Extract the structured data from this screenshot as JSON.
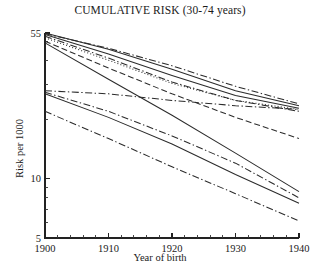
{
  "chart_data": {
    "type": "line",
    "title": "CUMULATIVE RISK (30-74 years)",
    "xlabel": "Year of birth",
    "ylabel": "Risk per 1000",
    "xlim": [
      1900,
      1940
    ],
    "ylim": [
      5,
      55
    ],
    "yscale": "log",
    "xscale": "linear",
    "grid": false,
    "legend": "none",
    "xticks": [
      1900,
      1910,
      1920,
      1930,
      1940
    ],
    "xtick_labels": [
      "1900",
      "1910",
      "1920",
      "1930",
      "1940"
    ],
    "xticks_minor": [
      1902,
      1904,
      1906,
      1908,
      1912,
      1914,
      1916,
      1918,
      1922,
      1924,
      1926,
      1928,
      1932,
      1934,
      1936,
      1938
    ],
    "yticks": [
      5,
      10,
      55
    ],
    "ytick_labels": [
      "5",
      "10",
      "55"
    ],
    "yticks_minor": [
      6,
      7,
      8,
      9,
      20,
      30,
      40,
      50
    ],
    "x": [
      1900,
      1910,
      1920,
      1930,
      1940
    ],
    "series": [
      {
        "name": "series-1",
        "style": "solid",
        "values": [
          55.0,
          45.5,
          36.0,
          28.0,
          23.5
        ]
      },
      {
        "name": "series-2",
        "style": "dash-dot",
        "values": [
          54.5,
          46.0,
          37.5,
          29.5,
          24.0
        ]
      },
      {
        "name": "series-3",
        "style": "solid",
        "values": [
          54.0,
          43.0,
          33.5,
          26.5,
          22.8
        ]
      },
      {
        "name": "series-4",
        "style": "dash-dot",
        "values": [
          53.0,
          41.0,
          31.0,
          25.0,
          22.0
        ]
      },
      {
        "name": "series-5",
        "style": "dotted",
        "values": [
          52.0,
          40.0,
          30.5,
          25.0,
          22.5
        ]
      },
      {
        "name": "series-6",
        "style": "dashed",
        "values": [
          50.0,
          36.5,
          27.0,
          20.5,
          16.0
        ]
      },
      {
        "name": "series-7",
        "style": "solid",
        "values": [
          49.0,
          32.0,
          21.0,
          13.5,
          8.6
        ]
      },
      {
        "name": "series-8",
        "style": "dash-dot",
        "values": [
          28.0,
          27.0,
          25.0,
          23.5,
          22.5
        ]
      },
      {
        "name": "series-9",
        "style": "dash-dot",
        "values": [
          27.5,
          22.0,
          16.5,
          12.0,
          8.0
        ]
      },
      {
        "name": "series-10",
        "style": "solid",
        "values": [
          27.0,
          20.5,
          15.0,
          10.5,
          7.5
        ]
      },
      {
        "name": "series-11",
        "style": "dash-dot",
        "values": [
          22.0,
          16.0,
          11.5,
          8.4,
          6.1
        ]
      }
    ]
  }
}
